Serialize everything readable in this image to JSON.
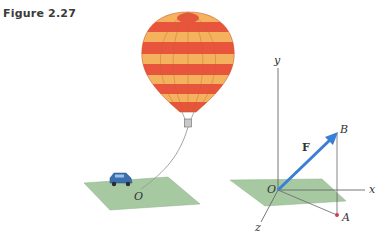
{
  "figure": {
    "title": "Figure 2.27",
    "left_panel": {
      "description": "Hot air balloon tethered by a rope to a car on a ground plane",
      "origin_label": "O",
      "colors": {
        "balloon_stripe_red": "#e8533b",
        "balloon_stripe_yellow": "#f7b35c",
        "ground_plane": "#9cc29a",
        "car": "#3b6fb0",
        "rope": "#9a9a9a"
      }
    },
    "right_panel": {
      "description": "3D coordinate axes with force vector F from origin O to point B; A is the projection of B onto the xz-plane",
      "axis_labels": {
        "x": "x",
        "y": "y",
        "z": "z"
      },
      "origin_label": "O",
      "vector_label": "F",
      "point_labels": {
        "B": "B",
        "A": "A"
      },
      "colors": {
        "vector": "#3a7fd6",
        "plane": "#9cc29a",
        "point_A": "#d9365a",
        "axes": "#555555"
      }
    }
  }
}
